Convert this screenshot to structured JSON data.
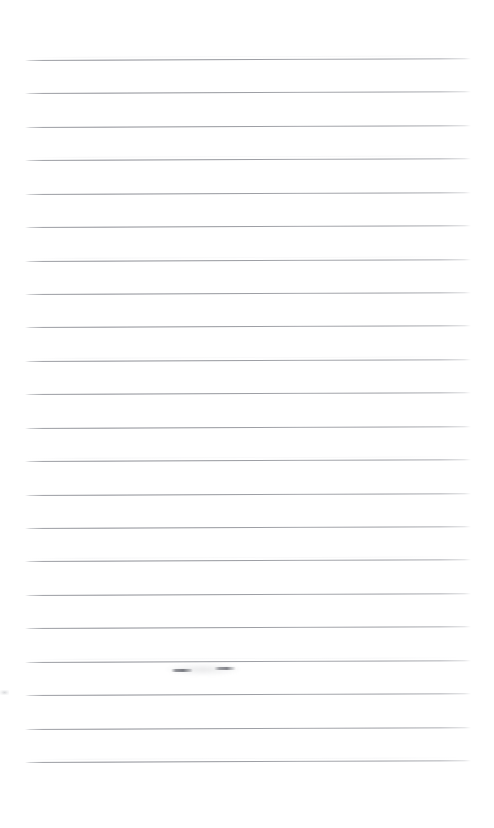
{
  "document": {
    "kind": "scanned-lined-paper",
    "title": "Blank ruled notebook page",
    "page_width": 494,
    "page_height": 828,
    "background_color": "#ffffff",
    "rule_color": "#8b8d94",
    "has_visible_text": false,
    "has_margin_rule": false,
    "text_content": ""
  },
  "ruling": {
    "line_count": 22,
    "first_line_y": 60,
    "line_spacing": 33.4,
    "line_start_x": 25,
    "line_end_x": 471,
    "line_thickness": 1,
    "skew_degrees": -0.22,
    "top_blank_margin": 60,
    "bottom_blank_margin": 53,
    "lines": [
      {
        "index": 1,
        "y": 60
      },
      {
        "index": 2,
        "y": 93
      },
      {
        "index": 3,
        "y": 127
      },
      {
        "index": 4,
        "y": 160
      },
      {
        "index": 5,
        "y": 194
      },
      {
        "index": 6,
        "y": 227
      },
      {
        "index": 7,
        "y": 261
      },
      {
        "index": 8,
        "y": 294
      },
      {
        "index": 9,
        "y": 327
      },
      {
        "index": 10,
        "y": 361
      },
      {
        "index": 11,
        "y": 394
      },
      {
        "index": 12,
        "y": 428
      },
      {
        "index": 13,
        "y": 461
      },
      {
        "index": 14,
        "y": 495
      },
      {
        "index": 15,
        "y": 528
      },
      {
        "index": 16,
        "y": 561
      },
      {
        "index": 17,
        "y": 595
      },
      {
        "index": 18,
        "y": 628
      },
      {
        "index": 19,
        "y": 662
      },
      {
        "index": 20,
        "y": 695
      },
      {
        "index": 21,
        "y": 729
      },
      {
        "index": 22,
        "y": 762
      }
    ]
  },
  "marks": {
    "description": "Faint erased pencil smudge interrupting line 19",
    "items": [
      {
        "name": "erased-mark-left",
        "x": 171,
        "y": 669,
        "width": 22,
        "height": 3
      },
      {
        "name": "erased-mark-right",
        "x": 214,
        "y": 667,
        "width": 22,
        "height": 3
      },
      {
        "name": "erased-mark-halo",
        "x": 166,
        "y": 663,
        "width": 74,
        "height": 13
      },
      {
        "name": "edge-speck",
        "x": 0,
        "y": 690,
        "width": 9,
        "height": 5
      }
    ]
  }
}
